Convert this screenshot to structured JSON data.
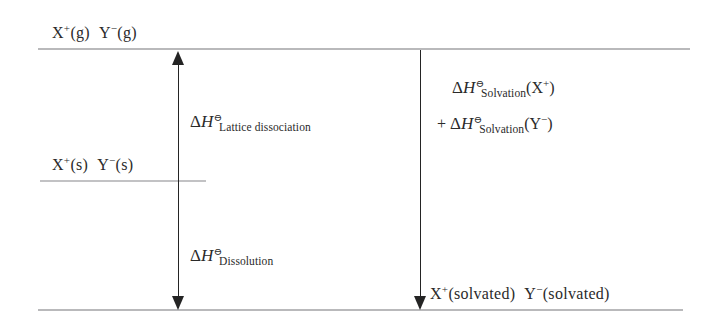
{
  "diagram": {
    "type": "enthalpy-level-diagram",
    "title_visible": false,
    "colors": {
      "level_line": "#b9b9bb",
      "arrow": "#242424",
      "text": "#2a2a2a",
      "background": "#ffffff"
    },
    "levels": [
      {
        "id": "gaseous-ions",
        "label_parts": {
          "cation": "X",
          "cation_charge": "+",
          "cation_state": "(g)",
          "anion": "Y",
          "anion_charge": "−",
          "anion_state": "(g)"
        },
        "label_text": "X⁺(g)  Y⁻(g)",
        "y_px": 48,
        "energy_rank": "highest"
      },
      {
        "id": "solid-ionic-lattice",
        "label_parts": {
          "cation": "X",
          "cation_charge": "+",
          "cation_state": "(s)",
          "anion": "Y",
          "anion_charge": "−",
          "anion_state": "(s)"
        },
        "label_text": "X⁺(s)  Y⁻(s)",
        "y_px": 180,
        "energy_rank": "middle"
      },
      {
        "id": "solvated-ions",
        "label_parts": {
          "cation": "X",
          "cation_charge": "+",
          "cation_state": "(solvated)",
          "anion": "Y",
          "anion_charge": "−",
          "anion_state": "(solvated)"
        },
        "label_text": "X⁺(solvated)  Y⁻(solvated)",
        "y_px": 309,
        "energy_rank": "lowest"
      }
    ],
    "arrows": [
      {
        "id": "lattice-dissociation-dissolution",
        "direction": "double",
        "from_level": "solvated-ions",
        "to_level": "gaseous-ions",
        "x_px": 178
      },
      {
        "id": "solvation",
        "direction": "down",
        "from_level": "gaseous-ions",
        "to_level": "solvated-ions",
        "x_px": 420
      }
    ],
    "enthalpy_labels": [
      {
        "id": "lattice-dissociation",
        "delta": "Δ",
        "symbol": "H",
        "standard": "⊖",
        "subscript": "Lattice dissociation",
        "full_text": "ΔH⊖(Lattice dissociation)"
      },
      {
        "id": "dissolution",
        "delta": "Δ",
        "symbol": "H",
        "standard": "⊖",
        "subscript": "Dissolution",
        "full_text": "ΔH⊖(Dissolution)"
      },
      {
        "id": "solvation-cation",
        "delta": "Δ",
        "symbol": "H",
        "standard": "⊖",
        "subscript": "Solvation",
        "argument_species": "X",
        "argument_charge": "+",
        "full_text": "ΔH⊖ Solvation(X⁺)"
      },
      {
        "id": "solvation-anion",
        "prefix": "+",
        "delta": "Δ",
        "symbol": "H",
        "standard": "⊖",
        "subscript": "Solvation",
        "argument_species": "Y",
        "argument_charge": "−",
        "full_text": "+ ΔH⊖ Solvation(Y⁻)"
      }
    ]
  }
}
